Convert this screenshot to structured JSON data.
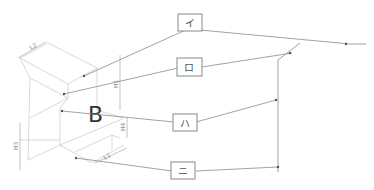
{
  "diagram": {
    "callouts": [
      {
        "id": "i",
        "label": "イ"
      },
      {
        "id": "ro",
        "label": "ロ"
      },
      {
        "id": "ha",
        "label": "ハ"
      },
      {
        "id": "ni",
        "label": "ニ"
      }
    ],
    "main_label": "B",
    "dimensions": {
      "top_width": "L2",
      "right_height": "H1",
      "left_height": "H3",
      "step_height": "H4",
      "bottom_width": "L1"
    }
  }
}
